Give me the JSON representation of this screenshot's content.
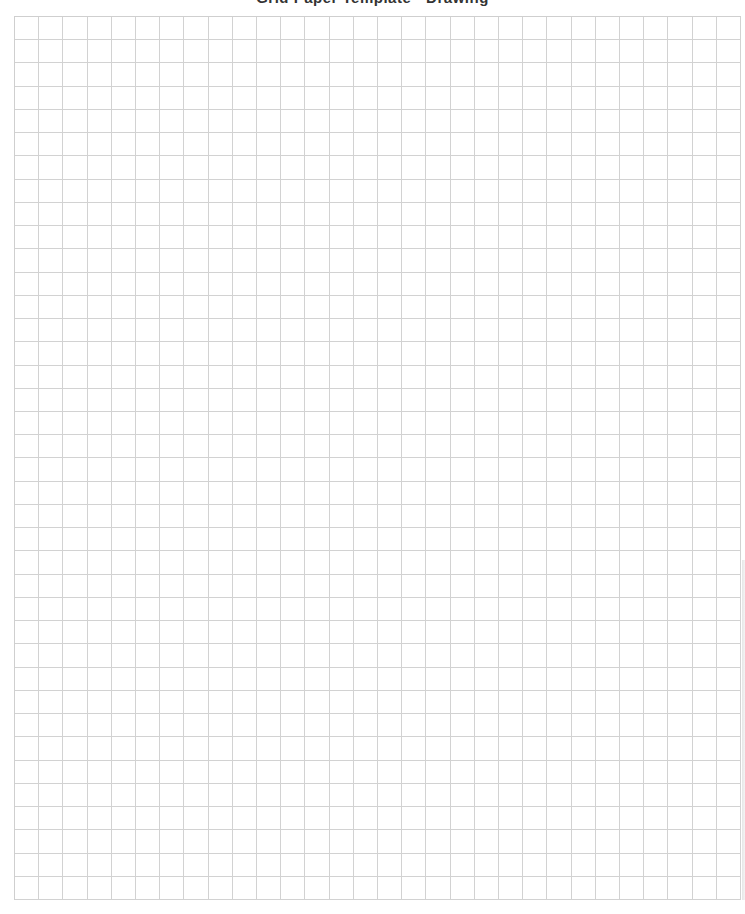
{
  "page": {
    "type": "graph-paper",
    "header_title": "Grid Paper Template  -  Drawing"
  },
  "grid": {
    "columns": 30,
    "rows": 38,
    "line_color": "#d2d2d2",
    "background": "#ffffff"
  }
}
